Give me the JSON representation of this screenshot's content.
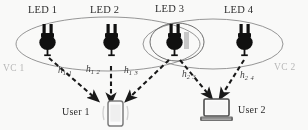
{
  "figure": {
    "type": "network-diagram",
    "background": "#ffffff",
    "leds": [
      {
        "label": "LED 1",
        "icon": "power-plug-icon",
        "x": 48,
        "y": 42
      },
      {
        "label": "LED 2",
        "icon": "power-plug-icon",
        "x": 112,
        "y": 42
      },
      {
        "label": "LED 3",
        "icon": "power-plug-icon",
        "x": 175,
        "y": 42
      },
      {
        "label": "LED 4",
        "icon": "power-plug-icon",
        "x": 245,
        "y": 42
      }
    ],
    "cells": [
      {
        "label": "VC 1",
        "color": "#b9b9b9",
        "cx": 108,
        "cy": 44,
        "rx": 92,
        "ry": 27
      },
      {
        "label": "VC 2",
        "color": "#b9b9b9",
        "cx": 213,
        "cy": 44,
        "rx": 70,
        "ry": 25
      },
      {
        "label": "",
        "color": "#666666",
        "cx": 177,
        "cy": 42,
        "rx": 27,
        "ry": 19
      }
    ],
    "users": [
      {
        "label": "User 1",
        "icon": "smartphone-icon",
        "x": 118,
        "y": 112
      },
      {
        "label": "User 2",
        "icon": "laptop-icon",
        "x": 217,
        "y": 110
      }
    ],
    "links": [
      {
        "label": "h",
        "sub": "1 1",
        "from": "LED 1",
        "to": "User 1",
        "style": "dashed-arrow"
      },
      {
        "label": "h",
        "sub": "1 2",
        "from": "LED 2",
        "to": "User 1",
        "style": "dashed-arrow"
      },
      {
        "label": "h",
        "sub": "1 3",
        "from": "LED 3",
        "to": "User 1",
        "style": "dashed-arrow"
      },
      {
        "label": "h",
        "sub": "2 3",
        "from": "LED 3",
        "to": "User 2",
        "style": "dashed-arrow"
      },
      {
        "label": "h",
        "sub": "2 4",
        "from": "LED 4",
        "to": "User 2",
        "style": "dashed-arrow"
      }
    ],
    "colors": {
      "stroke": "#3a3a3a",
      "ellipse": "#8a8a8a",
      "plug_body": "#0d0d0d",
      "vc_text": "#b9b9b9"
    }
  }
}
